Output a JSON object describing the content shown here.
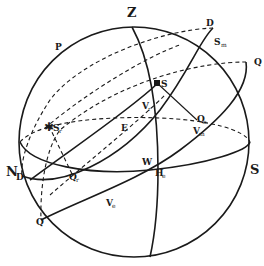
{
  "figure": {
    "stroke_color": "#1a1a1a",
    "background": "#ffffff"
  },
  "labels": {
    "zenith": "Z",
    "pole": "P",
    "north": "N",
    "south": "S",
    "east": "E",
    "west": "W",
    "d_top": "D",
    "d_left": "D",
    "q_top": "Q",
    "q_top_sub": "1",
    "q_bottom": "Q",
    "star_mid": "S",
    "star_mid_sub": "",
    "s_m": "S",
    "s_m_sub": "m",
    "s_r": "S",
    "s_r_sub": "r",
    "v_r": "V",
    "v_r_sub": "r",
    "q_e": "Q",
    "q_e_sub": "e",
    "v_m": "V",
    "v_m_sub": "m",
    "h_e": "H",
    "h_e_sub": "e",
    "q_r": "Q",
    "q_r_sub": "r",
    "v_e": "V",
    "v_e_sub": "e"
  }
}
